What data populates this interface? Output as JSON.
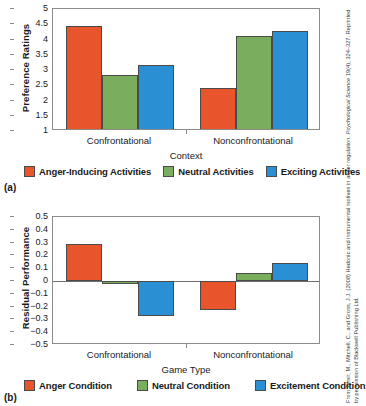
{
  "credit": {
    "line1_a": "From Tamir, M., Mitchell, C., and Gross, J.J. (2008) Hedonic and instrumental motives in anger regulation.",
    "line1_b": " Psychological Science",
    "line1_c": " 19(4), 324–327. Reprinted by permission of Blackwell Publishing Ltd."
  },
  "panels": {
    "a": {
      "tag": "(a)",
      "legend": [
        {
          "label": "Anger-Inducing Activities",
          "color": "#E8542B"
        },
        {
          "label": "Neutral Activities",
          "color": "#7BAD5E"
        },
        {
          "label": "Exciting Activities",
          "color": "#2B8FD4"
        }
      ]
    },
    "b": {
      "tag": "(b)",
      "legend": [
        {
          "label": "Anger Condition",
          "color": "#E8542B"
        },
        {
          "label": "Neutral Condition",
          "color": "#7BAD5E"
        },
        {
          "label": "Excitement Condition",
          "color": "#2B8FD4"
        }
      ]
    }
  },
  "chart_data": [
    {
      "type": "bar",
      "panel": "(a)",
      "title": "",
      "xlabel": "Context",
      "ylabel": "Preference Ratings",
      "categories": [
        "Confrontational",
        "Nonconfrontational"
      ],
      "ylim": [
        1,
        5
      ],
      "yticks": [
        "1",
        "1.5",
        "2",
        "2.5",
        "3",
        "3.5",
        "4",
        "4.5",
        "5"
      ],
      "ytick_values": [
        1,
        1.5,
        2,
        2.5,
        3,
        3.5,
        4,
        4.5,
        5
      ],
      "grid": false,
      "legend_position": "bottom",
      "series": [
        {
          "name": "Anger-Inducing Activities",
          "color": "#E8542B",
          "values": [
            4.45,
            2.4
          ]
        },
        {
          "name": "Neutral Activities",
          "color": "#7BAD5E",
          "values": [
            2.85,
            4.1
          ]
        },
        {
          "name": "Exciting Activities",
          "color": "#2B8FD4",
          "values": [
            3.18,
            4.27
          ]
        }
      ]
    },
    {
      "type": "bar",
      "panel": "(b)",
      "title": "",
      "xlabel": "Game Type",
      "ylabel": "Residual Performance",
      "categories": [
        "Confrontational",
        "Nonconfrontational"
      ],
      "ylim": [
        -0.5,
        0.5
      ],
      "yticks": [
        "0.5",
        "0.4",
        "0.3",
        "0.2",
        "0.1",
        "0",
        "−0.1",
        "−0.2",
        "−0.3",
        "−0.4",
        "−0.5"
      ],
      "ytick_values": [
        0.5,
        0.4,
        0.3,
        0.2,
        0.1,
        0,
        -0.1,
        -0.2,
        -0.3,
        -0.4,
        -0.5
      ],
      "grid": false,
      "legend_position": "bottom",
      "series": [
        {
          "name": "Anger Condition",
          "color": "#E8542B",
          "values": [
            0.29,
            -0.23
          ]
        },
        {
          "name": "Neutral Condition",
          "color": "#7BAD5E",
          "values": [
            -0.02,
            0.065
          ]
        },
        {
          "name": "Excitement Condition",
          "color": "#2B8FD4",
          "values": [
            -0.27,
            0.14
          ]
        }
      ]
    }
  ]
}
